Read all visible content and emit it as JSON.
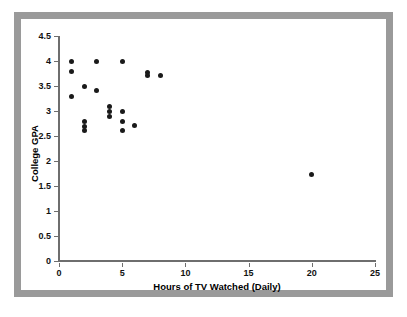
{
  "chart_data": {
    "type": "scatter",
    "title": "",
    "xlabel": "Hours of TV Watched (Daily)",
    "ylabel": "College GPA",
    "xlim": [
      0,
      25
    ],
    "ylim": [
      0,
      4.5
    ],
    "xticks": [
      0,
      5,
      10,
      15,
      20,
      25
    ],
    "yticks": [
      0,
      0.5,
      1,
      1.5,
      2,
      2.5,
      3,
      3.5,
      4,
      4.5
    ],
    "xtick_labels": [
      "0",
      "5",
      "10",
      "15",
      "20",
      "25"
    ],
    "ytick_labels": [
      "0",
      "0.5",
      "1",
      "1.5",
      "2",
      "2.5",
      "3",
      "3.5",
      "4",
      "4.5"
    ],
    "grid": false,
    "legend": null,
    "marker": "filled-circle",
    "marker_color": "#1a1a1a",
    "points": [
      {
        "x": 1.0,
        "y": 4.0
      },
      {
        "x": 1.0,
        "y": 3.8
      },
      {
        "x": 1.0,
        "y": 3.3
      },
      {
        "x": 2.0,
        "y": 3.5
      },
      {
        "x": 2.0,
        "y": 2.8
      },
      {
        "x": 2.0,
        "y": 2.7
      },
      {
        "x": 2.0,
        "y": 2.62
      },
      {
        "x": 3.0,
        "y": 4.0
      },
      {
        "x": 3.0,
        "y": 3.42
      },
      {
        "x": 4.0,
        "y": 3.1
      },
      {
        "x": 4.0,
        "y": 3.0
      },
      {
        "x": 4.0,
        "y": 2.9
      },
      {
        "x": 5.0,
        "y": 4.0
      },
      {
        "x": 5.0,
        "y": 3.0
      },
      {
        "x": 5.0,
        "y": 2.8
      },
      {
        "x": 5.0,
        "y": 2.62
      },
      {
        "x": 6.0,
        "y": 2.72
      },
      {
        "x": 7.0,
        "y": 3.78
      },
      {
        "x": 7.0,
        "y": 3.72
      },
      {
        "x": 8.0,
        "y": 3.72
      },
      {
        "x": 20.0,
        "y": 1.74
      }
    ]
  },
  "figure": {
    "border_color": "#9a9a9a",
    "background_color": "#ffffff",
    "axis_color": "#6e6e6e"
  }
}
